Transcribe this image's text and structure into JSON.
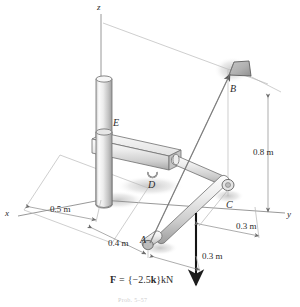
{
  "figure": {
    "type": "engineering-statics-free-body-diagram",
    "background_color": "#ffffff",
    "line_color": "#4a4a4a",
    "metal_light": "#f2f2f2",
    "metal_mid": "#d8d8d8",
    "metal_dark": "#a9a9a9",
    "shadow_color": "#bcbcbc"
  },
  "axes": [
    {
      "name": "z-axis",
      "label": "z"
    },
    {
      "name": "x-axis",
      "label": "x"
    },
    {
      "name": "y-axis",
      "label": "y"
    }
  ],
  "points": [
    {
      "name": "point-a",
      "label": "A"
    },
    {
      "name": "point-b",
      "label": "B"
    },
    {
      "name": "point-c",
      "label": "C"
    },
    {
      "name": "point-d",
      "label": "D"
    },
    {
      "name": "point-e",
      "label": "E"
    }
  ],
  "dimensions": [
    {
      "name": "dimension-0-5m",
      "label": "0.5 m"
    },
    {
      "name": "dimension-0-4m",
      "label": "0.4 m"
    },
    {
      "name": "dimension-0-8m",
      "label": "0.8 m"
    },
    {
      "name": "dimension-0-3m-upper",
      "label": "0.3 m"
    },
    {
      "name": "dimension-0-3m-lower",
      "label": "0.3 m"
    }
  ],
  "load": {
    "name": "applied-force",
    "symbol": "F",
    "equals": "=",
    "expression": "{−2.5k}",
    "unit": "kN",
    "full_label": "F = {−2.5k} kN",
    "direction": "downward (negative z)",
    "magnitude": 2.5
  },
  "caption": {
    "name": "figure-caption",
    "text": "Prob. 5–57"
  }
}
